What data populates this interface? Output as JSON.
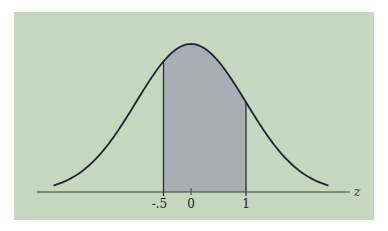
{
  "chart_data": {
    "type": "area",
    "title": "",
    "distribution": "standard normal",
    "mean": 0,
    "sd": 1,
    "x_range_drawn": [
      -2.5,
      2.5
    ],
    "shaded_interval": [
      -0.5,
      1
    ],
    "xlabel": "z",
    "ylabel": "",
    "tick_labels": [
      "-.5",
      "0",
      "1"
    ],
    "tick_values": [
      -0.5,
      0,
      1
    ],
    "grid": false,
    "legend": null
  },
  "labels": {
    "tick_neg_half": "-.5",
    "tick_zero": "0",
    "tick_one": "1",
    "axis_variable": "z"
  },
  "colors": {
    "panel_bg": "#c6d6c1",
    "shade": "#a9adb4",
    "curve": "#1f2433",
    "axis": "#3a3f3a"
  },
  "geometry": {
    "mean_px": 191,
    "px_per_sd": 55,
    "baseline_px": 192,
    "peak_height_px": 148
  }
}
